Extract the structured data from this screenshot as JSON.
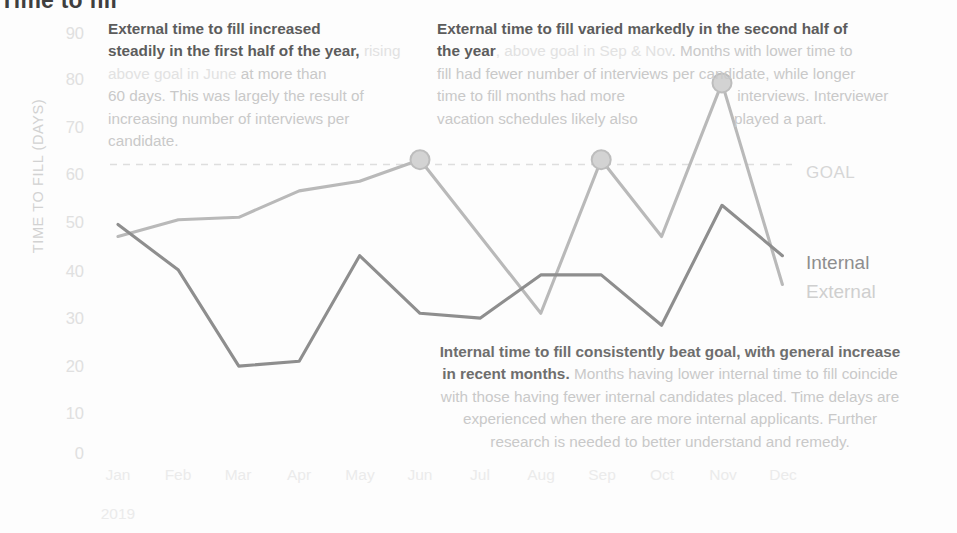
{
  "chart_data": {
    "type": "line",
    "title": "Time to fill",
    "xlabel": "",
    "ylabel": "TIME TO FILL (DAYS)",
    "year": "2019",
    "categories": [
      "Jan",
      "Feb",
      "Mar",
      "Apr",
      "May",
      "Jun",
      "Jul",
      "Aug",
      "Sep",
      "Oct",
      "Nov",
      "Dec"
    ],
    "ylim": [
      0,
      90
    ],
    "yticks": [
      90,
      80,
      70,
      60,
      50,
      40,
      30,
      20,
      10,
      0
    ],
    "grid": false,
    "legend_position": "right-inline",
    "series": [
      {
        "name": "External",
        "color": "#b9b9b9",
        "values": [
          45,
          48.5,
          49,
          54.5,
          56.5,
          61,
          45,
          29,
          61,
          45,
          77,
          35
        ],
        "markers": [
          {
            "category": "Jun",
            "value": 61
          },
          {
            "category": "Sep",
            "value": 61
          },
          {
            "category": "Nov",
            "value": 77
          }
        ]
      },
      {
        "name": "Internal",
        "color": "#8e8e8e",
        "values": [
          47.5,
          38,
          18,
          19,
          41,
          29,
          28,
          37,
          37,
          26.5,
          51.5,
          41
        ],
        "markers": []
      }
    ],
    "reference_line": {
      "label": "GOAL",
      "value": 60,
      "style": "dashed",
      "color": "#dedede"
    },
    "annotations": [
      {
        "id": "external-first-half",
        "bold_lead": "External time to fill increased steadily in the first half of the year,",
        "faint_phrase": "rising above goal in June",
        "rest": "at more than 60 days. This was largely the result of increasing number of interviews per candidate."
      },
      {
        "id": "external-second-half",
        "bold_lead": "External time to fill varied markedly in the second half of the year",
        "faint_phrase": ", above goal in Sep & Nov",
        "rest": ". Months with lower time to fill had fewer number of interviews per candidate, while longer time to fill months had more interviews. Interviewer vacation schedules likely also played a part."
      },
      {
        "id": "internal-summary",
        "bold_lead": "Internal time to fill consistently beat goal, with general increase in recent months.",
        "faint_phrase": "",
        "rest": "Months having lower internal time to fill coincide with those having fewer internal candidates placed. Time delays are experienced when there are more internal applicants. Further research is needed to better understand and remedy."
      }
    ]
  },
  "labels": {
    "title": "Time to fill",
    "y_axis_title": "TIME TO FILL (DAYS)",
    "year": "2019",
    "goal": "GOAL",
    "internal": "Internal",
    "external": "External"
  },
  "annotation_external_h1": {
    "bold1": "External time to fill increased",
    "bold2": "steadily in the first half of the year,",
    "faint1": "rising above goal in June",
    "body1": "at more than",
    "body2": "60 days. This was largely the result of",
    "body3": "increasing number of interviews per",
    "body4": "candidate."
  },
  "annotation_external_h2": {
    "bold1": "External time to fill varied markedly in the second half of",
    "bold2": "the year",
    "faint1": ", above goal in Sep & Nov",
    "body1": ". Months with lower time to",
    "body2": "fill had fewer number of interviews per candidate, while longer",
    "body3": "time to fill months had more",
    "body4": "interviews. Interviewer",
    "body5": "vacation schedules likely also",
    "body6": "played a part."
  },
  "annotation_internal": {
    "line1a": "Internal time to fill ",
    "line1b": "consistently beat goal",
    "line1c": ", ",
    "line1d": "with gene",
    "line1e": "ral increase",
    "line2a": "in recent months.",
    "line2b": " Months having lower internal time to fill coincide",
    "line3": "with those having fewer internal candidates placed. Time delays are",
    "line4": "experienced when there are more internal applicants. Further",
    "line5": "research is needed to better understand and remedy."
  }
}
